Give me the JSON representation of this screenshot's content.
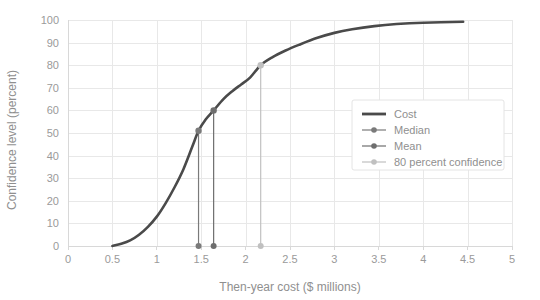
{
  "chart_data": {
    "type": "line",
    "title": "",
    "xlabel": "Then-year cost ($ millions)",
    "ylabel": "Confidence level (percent)",
    "xlim": [
      0,
      5
    ],
    "ylim": [
      0,
      100
    ],
    "grid": true,
    "legend_position": "top-right-inside",
    "xticks": [
      "0",
      "0.5",
      "1",
      "1.5",
      "2",
      "2.5",
      "3",
      "3.5",
      "4",
      "4.5",
      "5"
    ],
    "xtick_values": [
      0,
      0.5,
      1,
      1.5,
      2,
      2.5,
      3,
      3.5,
      4,
      4.5,
      5
    ],
    "yticks": [
      "0",
      "10",
      "20",
      "30",
      "40",
      "50",
      "60",
      "70",
      "80",
      "90",
      "100"
    ],
    "ytick_values": [
      0,
      10,
      20,
      30,
      40,
      50,
      60,
      70,
      80,
      90,
      100
    ],
    "series": [
      {
        "name": "Cost",
        "type": "line",
        "color": "#4a4a4a",
        "x": [
          0.5,
          0.6,
          0.7,
          0.8,
          0.9,
          1.0,
          1.1,
          1.2,
          1.3,
          1.4,
          1.47,
          1.55,
          1.64,
          1.75,
          1.85,
          1.95,
          2.05,
          2.17,
          2.3,
          2.45,
          2.6,
          2.8,
          3.0,
          3.2,
          3.45,
          3.7,
          4.0,
          4.45
        ],
        "y": [
          0.0,
          1.0,
          2.5,
          5.0,
          8.5,
          13.0,
          19.0,
          26.0,
          34.0,
          44.0,
          51.0,
          56.0,
          60.0,
          65.0,
          68.5,
          71.5,
          74.5,
          80.0,
          83.5,
          86.5,
          89.0,
          92.0,
          94.3,
          95.9,
          97.3,
          98.2,
          98.8,
          99.2
        ]
      },
      {
        "name": "Median",
        "type": "marker",
        "color": "#7a7a7a",
        "x": 1.47,
        "y": 51
      },
      {
        "name": "Mean",
        "type": "marker",
        "color": "#6e6e6e",
        "x": 1.64,
        "y": 60
      },
      {
        "name": "80 percent confidence",
        "type": "marker",
        "color": "#c0c0c0",
        "x": 2.17,
        "y": 80
      }
    ]
  },
  "legend": {
    "items": [
      {
        "label": "Cost"
      },
      {
        "label": "Median"
      },
      {
        "label": "Mean"
      },
      {
        "label": "80 percent confidence"
      }
    ]
  },
  "colors": {
    "cost_line": "#4a4a4a",
    "median": "#7a7a7a",
    "mean": "#6e6e6e",
    "confidence_80": "#c0c0c0",
    "grid": "#e8e8e8",
    "axis": "#d8d8d8",
    "tick_label": "#9a9a9a",
    "axis_title": "#8f8f8f"
  }
}
